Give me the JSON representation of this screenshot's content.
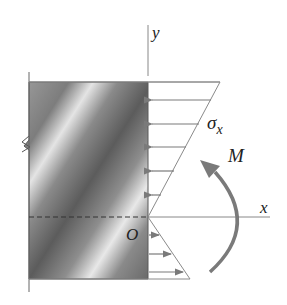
{
  "diagram": {
    "labels": {
      "y_axis": "y",
      "x_axis": "x",
      "origin": "O",
      "stress": "σ",
      "stress_sub": "x",
      "moment": "M"
    },
    "colors": {
      "line": "#8a8a8a",
      "arrow": "#7a7a7a",
      "moment_arrow": "#777777",
      "block_dark": "#5a5a5a",
      "block_light": "#e8e8e8",
      "text": "#222222"
    },
    "stress_arrows": {
      "compressive_count": 5,
      "tensile_count": 3
    }
  }
}
